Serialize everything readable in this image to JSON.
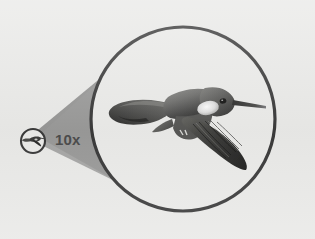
{
  "scene": {
    "title": "Magnified bird view",
    "background_color": "#e9e9e7",
    "cone": {
      "name": "magnification-cone",
      "fill_color": "#969695",
      "description": "gray field-of-view cone from the small circle to the large circle"
    },
    "magnifier_label": {
      "text": "10x",
      "color": "#4b4b4b"
    },
    "source_marker": {
      "name": "source-thumbnail",
      "stroke_color": "#3a3a3a",
      "diameter_px": 26,
      "center_x": 33,
      "center_y": 141,
      "subject": "hummingbird"
    },
    "magnified_view": {
      "name": "magnified-circle",
      "stroke_color": "#3a3a3a",
      "stroke_width_px": 3,
      "diameter_px": 190,
      "center_x": 183,
      "center_y": 119,
      "subject": "hummingbird",
      "subject_description": "grayscale hummingbird in flight, beak pointing right, wings spread"
    }
  }
}
